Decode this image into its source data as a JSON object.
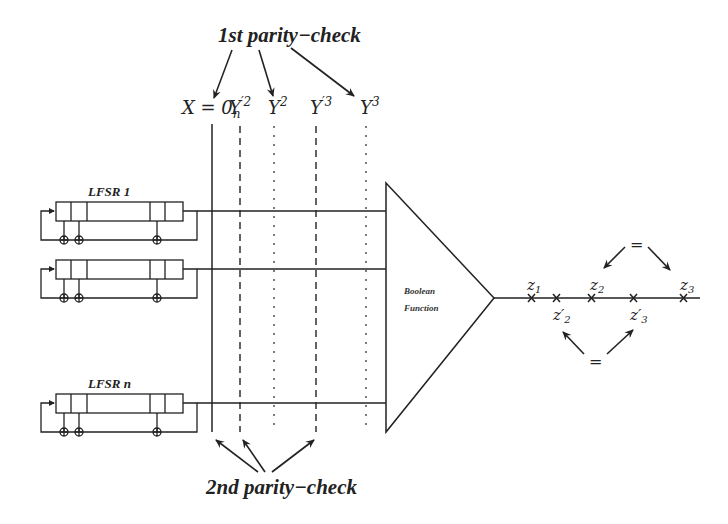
{
  "diagram": {
    "title_top": "1st parity−check",
    "title_bottom": "2nd parity−check",
    "columns": [
      {
        "label": "X = 0",
        "sub": "n",
        "sup": "",
        "style": "solid"
      },
      {
        "label": "Y",
        "sup": "′2",
        "style": "dashed"
      },
      {
        "label": "Y",
        "sup": "2",
        "style": "dotted"
      },
      {
        "label": "Y",
        "sup": "′3",
        "style": "dashed"
      },
      {
        "label": "Y",
        "sup": "3",
        "style": "dotted"
      }
    ],
    "lfsrs": [
      {
        "label": "LFSR 1"
      },
      {
        "label": ""
      },
      {
        "label": "LFSR n"
      }
    ],
    "boolean_function": {
      "line1": "Boolean",
      "line2": "Function"
    },
    "output_points": [
      {
        "label": "z",
        "sub": "1",
        "position": "above"
      },
      {
        "label": "z′",
        "sub": "2",
        "position": "below"
      },
      {
        "label": "z",
        "sub": "2",
        "position": "above"
      },
      {
        "label": "z′",
        "sub": "3",
        "position": "below"
      },
      {
        "label": "z",
        "sub": "3",
        "position": "above"
      }
    ],
    "equal_top": "=",
    "equal_bottom": "="
  }
}
